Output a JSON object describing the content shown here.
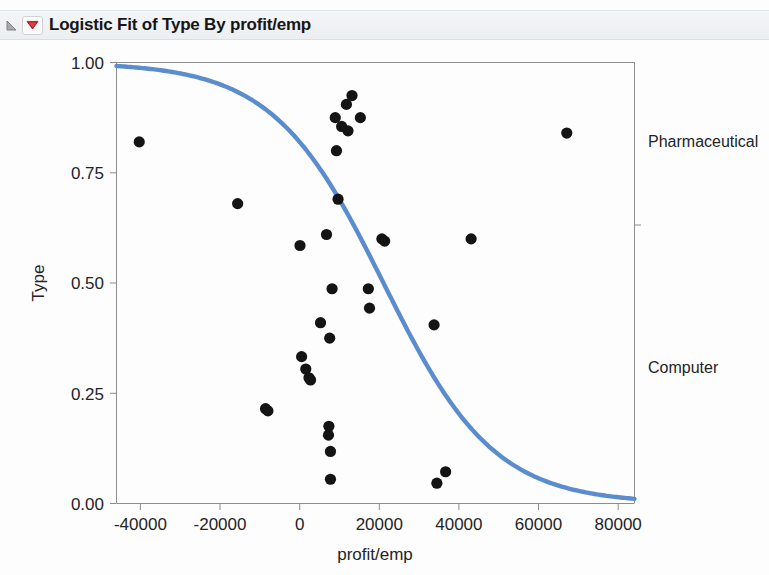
{
  "window": {
    "title": "Logistic Fit of Type By profit/emp",
    "disclosure_icon": "triangle-collapse-icon",
    "menu_icon": "red-triangle-menu-icon",
    "menu_icon_color": "#c9151b"
  },
  "colors": {
    "curve": "#5b8ccd",
    "point": "#141414",
    "axis": "#8d8d8d",
    "text": "#242424",
    "panel": "#eceef1"
  },
  "chart_data": {
    "type": "scatter",
    "title": "Logistic Fit of Type By profit/emp",
    "xlabel": "profit/emp",
    "ylabel": "Type",
    "xlim": [
      -46000,
      84000
    ],
    "ylim": [
      0,
      1
    ],
    "xticks": [
      -40000,
      -20000,
      0,
      20000,
      40000,
      60000,
      80000
    ],
    "xtick_labels": [
      "-40000",
      "-20000",
      "0",
      "20000",
      "40000",
      "60000",
      "80000"
    ],
    "yticks": [
      0.0,
      0.25,
      0.5,
      0.75,
      1.0
    ],
    "ytick_labels": [
      "0.00",
      "0.25",
      "0.50",
      "0.75",
      "1.00"
    ],
    "grid": false,
    "right_axis_categories": [
      {
        "label": "Pharmaceutical",
        "y": 0.82
      },
      {
        "label": "Computer",
        "y": 0.3
      }
    ],
    "series": [
      {
        "name": "observations",
        "type": "scatter",
        "marker": "filled-circle",
        "color": "#141414",
        "points": [
          {
            "x": -40300,
            "y": 0.82
          },
          {
            "x": -15600,
            "y": 0.68
          },
          {
            "x": -8600,
            "y": 0.215
          },
          {
            "x": -8000,
            "y": 0.21
          },
          {
            "x": 50,
            "y": 0.585
          },
          {
            "x": 450,
            "y": 0.333
          },
          {
            "x": 1500,
            "y": 0.305
          },
          {
            "x": 2300,
            "y": 0.285
          },
          {
            "x": 2700,
            "y": 0.28
          },
          {
            "x": 5200,
            "y": 0.41
          },
          {
            "x": 6700,
            "y": 0.61
          },
          {
            "x": 7200,
            "y": 0.155
          },
          {
            "x": 7300,
            "y": 0.175
          },
          {
            "x": 7500,
            "y": 0.375
          },
          {
            "x": 7700,
            "y": 0.118
          },
          {
            "x": 7700,
            "y": 0.055
          },
          {
            "x": 8100,
            "y": 0.487
          },
          {
            "x": 8900,
            "y": 0.875
          },
          {
            "x": 9200,
            "y": 0.8
          },
          {
            "x": 9600,
            "y": 0.69
          },
          {
            "x": 10500,
            "y": 0.855
          },
          {
            "x": 11700,
            "y": 0.905
          },
          {
            "x": 12100,
            "y": 0.845
          },
          {
            "x": 13100,
            "y": 0.925
          },
          {
            "x": 15200,
            "y": 0.875
          },
          {
            "x": 17200,
            "y": 0.487
          },
          {
            "x": 17500,
            "y": 0.443
          },
          {
            "x": 20600,
            "y": 0.6
          },
          {
            "x": 21300,
            "y": 0.595
          },
          {
            "x": 33700,
            "y": 0.405
          },
          {
            "x": 34400,
            "y": 0.046
          },
          {
            "x": 36600,
            "y": 0.072
          },
          {
            "x": 43000,
            "y": 0.6
          },
          {
            "x": 67000,
            "y": 0.84
          }
        ]
      },
      {
        "name": "logistic-fit",
        "type": "line",
        "color": "#5b8ccd",
        "model": "logistic",
        "midpoint_x": 21000,
        "slope": 7.2e-05,
        "description": "Decreasing logistic curve from 1.00 at left to ~0.01 at right"
      }
    ]
  }
}
